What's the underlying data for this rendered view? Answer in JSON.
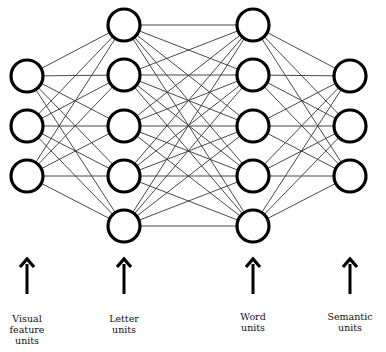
{
  "diagram": {
    "type": "neural-network",
    "colors": {
      "edge": "#333333",
      "node_stroke": "#000000",
      "node_fill": "#ffffff",
      "arrow": "#000000",
      "background": "#ffffff"
    },
    "node_radius": 16,
    "layers": [
      {
        "name": "visual-feature",
        "label_lines": [
          "Visual",
          "feature",
          "units"
        ],
        "x": 27,
        "nodes_y": [
          76,
          126,
          176
        ]
      },
      {
        "name": "letter",
        "label_lines": [
          "Letter",
          "units"
        ],
        "x": 124,
        "nodes_y": [
          25,
          75,
          126,
          176,
          226
        ]
      },
      {
        "name": "word",
        "label_lines": [
          "Word",
          "units"
        ],
        "x": 253,
        "nodes_y": [
          25,
          75,
          126,
          176,
          226
        ]
      },
      {
        "name": "semantic",
        "label_lines": [
          "Semantic",
          "units"
        ],
        "x": 350,
        "nodes_y": [
          76,
          126,
          176
        ]
      }
    ],
    "arrows": {
      "y_top": 258,
      "y_bottom": 294
    },
    "labels": [
      {
        "text_lines": [
          "Visual",
          "feature",
          "units"
        ],
        "x": 27,
        "y": 313
      },
      {
        "text_lines": [
          "Letter",
          "units"
        ],
        "x": 124,
        "y": 317
      },
      {
        "text_lines": [
          "Word",
          "units"
        ],
        "x": 253,
        "y": 313
      },
      {
        "text_lines": [
          "Semantic",
          "units"
        ],
        "x": 350,
        "y": 313
      }
    ]
  }
}
